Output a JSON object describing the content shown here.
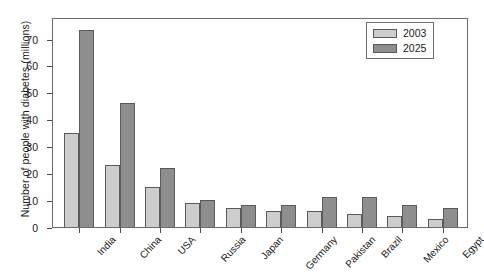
{
  "chart_data": {
    "type": "bar",
    "title": "",
    "subtitle": "",
    "xlabel": "",
    "ylabel": "Number of people with diabetes (millions)",
    "categories": [
      "India",
      "China",
      "USA",
      "Russia",
      "Japan",
      "Germany",
      "Pakistan",
      "Brazil",
      "Mexico",
      "Egypt"
    ],
    "series": [
      {
        "name": "2003",
        "color": "#cdcdcd",
        "values": [
          35,
          23,
          15,
          9,
          7,
          6,
          6,
          5,
          4,
          3
        ]
      },
      {
        "name": "2025",
        "color": "#8e8e8e",
        "values": [
          73,
          46,
          22,
          10,
          8,
          8,
          11,
          11,
          8,
          7
        ]
      }
    ],
    "ylim": [
      0,
      78
    ],
    "yticks": [
      0,
      10,
      20,
      30,
      40,
      50,
      60,
      70
    ],
    "ytick_labels": [
      "0",
      "10",
      "20",
      "30",
      "40",
      "50",
      "60",
      "70"
    ],
    "grid": false,
    "legend_position": "top-right",
    "legend_entries": [
      "2003",
      "2025"
    ],
    "annotations": []
  }
}
